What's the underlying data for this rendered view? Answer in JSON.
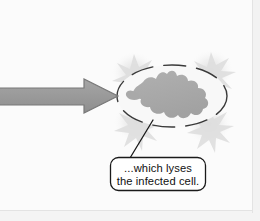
{
  "figure": {
    "background_color": "#fbfbfb",
    "border_color": "#e3e3e3",
    "width": 260,
    "height": 221
  },
  "arrow": {
    "name": "process-arrow",
    "direction": "right",
    "fill_color": "#9b9b9b",
    "stroke_color": "#6f6f6f",
    "shaft": {
      "x1": 0,
      "y1": 88,
      "x2": 84,
      "y2": 105
    },
    "head": {
      "tip_x": 118,
      "tip_y": 96,
      "back_x": 84,
      "top_y": 79,
      "bottom_y": 113
    }
  },
  "cell": {
    "name": "infected-cell",
    "membrane_style": "dashed",
    "membrane_color": "#3a3a3a",
    "center_x": 172,
    "center_y": 96,
    "radius_x": 55,
    "radius_y": 31,
    "interior_color": "#f7f7f7"
  },
  "blob": {
    "name": "lysed-cell-contents",
    "fill_color": "#a9a9a9",
    "description": "irregular amoeboid mass of viral progeny and cell debris"
  },
  "bursts": {
    "name": "lysis-burst",
    "color": "#d9d9d9",
    "glow_color": "#ededed",
    "count": 4,
    "positions": [
      {
        "cx": 134,
        "cy": 72
      },
      {
        "cx": 211,
        "cy": 70
      },
      {
        "cx": 136,
        "cy": 122
      },
      {
        "cx": 209,
        "cy": 124
      }
    ]
  },
  "callout": {
    "name": "lysis-callout",
    "box": {
      "x": 110,
      "y": 157,
      "width": 96,
      "height": 34,
      "radius": 8
    },
    "fill_color": "#ffffff",
    "stroke_color": "#1a1a1a",
    "leader_line": {
      "x1": 130,
      "y1": 158,
      "x2": 153,
      "y2": 120
    },
    "lines": [
      "...which lyses",
      "the infected cell."
    ],
    "line1": "...which lyses",
    "line2": "the infected cell."
  }
}
